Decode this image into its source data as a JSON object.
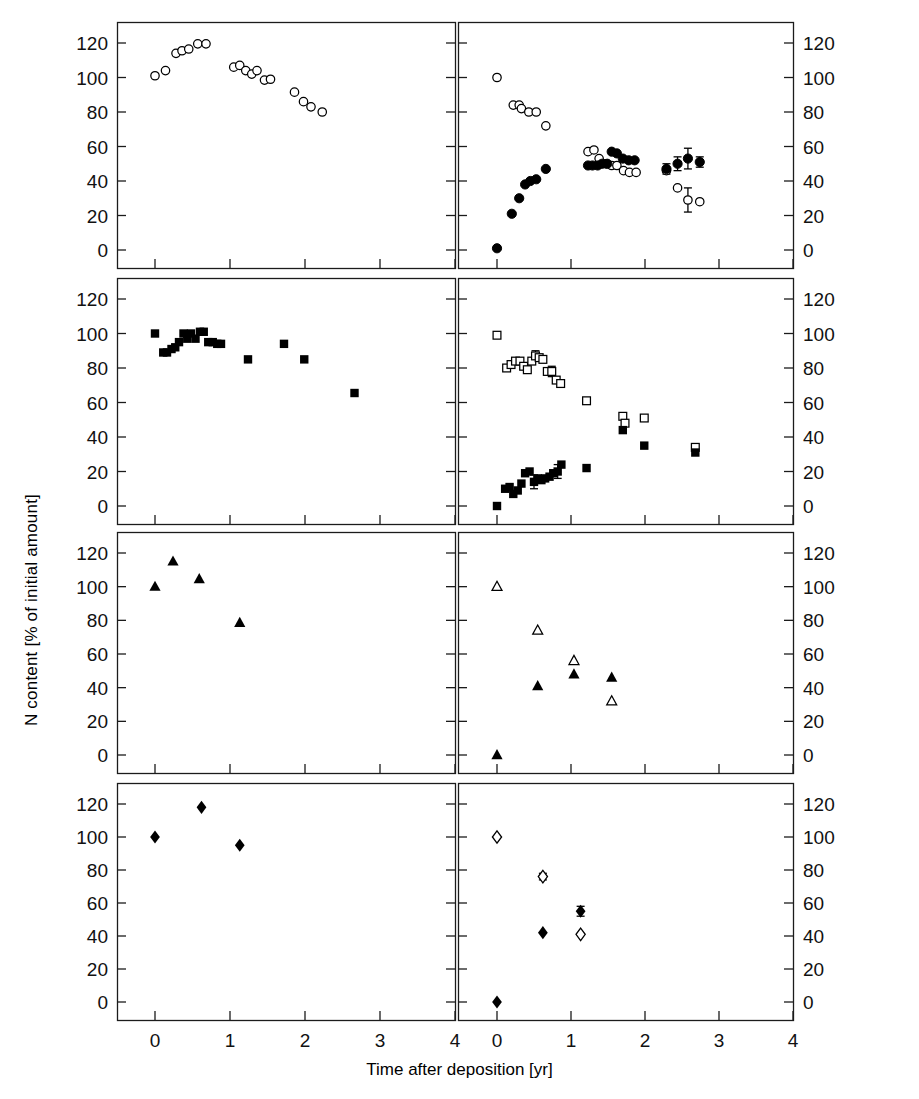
{
  "figure": {
    "xlabel": "Time after deposition [yr]",
    "ylabel_left": "N content [% of initial amount]",
    "ylabel_right": "Released N or incorporated N [% of initial amount]",
    "legend": {
      "line1": "N release (open symbols)",
      "line2": "N incorporation (closed symbols)"
    },
    "panel_titles": {
      "aubure09": "Aubure, 0.9% N",
      "aubure15": "Aubure, 1.5% N",
      "ebrach": "Ebrach",
      "collelongo": "Collelongo"
    },
    "yticks": [
      0,
      20,
      40,
      60,
      80,
      100,
      120
    ],
    "xticks": [
      0,
      1,
      2,
      3,
      4
    ],
    "colors": {
      "axis": "#1b1b1b",
      "marker": "#000000",
      "background": "#ffffff"
    }
  },
  "chart_data": [
    {
      "type": "scatter",
      "panel": "Aubure, 0.9% N — N content",
      "row": 0,
      "col": 0,
      "xlabel": "Time after deposition [yr]",
      "ylabel": "N content [% of initial amount]",
      "xlim": [
        -0.32,
        4.0
      ],
      "ylim": [
        -8,
        130
      ],
      "grid": false,
      "series": [
        {
          "name": "N content",
          "marker": "open-circle",
          "points": [
            [
              0.0,
              101
            ],
            [
              0.14,
              104
            ],
            [
              0.28,
              114
            ],
            [
              0.36,
              115.5
            ],
            [
              0.45,
              116.5
            ],
            [
              0.57,
              119.5
            ],
            [
              0.68,
              119.5
            ],
            [
              1.05,
              106
            ],
            [
              1.13,
              107
            ],
            [
              1.21,
              104
            ],
            [
              1.29,
              102
            ],
            [
              1.36,
              104
            ],
            [
              1.46,
              98.5
            ],
            [
              1.54,
              99
            ],
            [
              1.86,
              91.5
            ],
            [
              1.98,
              86
            ],
            [
              2.08,
              83
            ],
            [
              2.23,
              80
            ]
          ]
        }
      ]
    },
    {
      "type": "scatter",
      "panel": "Aubure, 0.9% N — N release / incorporation",
      "row": 0,
      "col": 1,
      "xlim": [
        -0.32,
        4.0
      ],
      "ylim": [
        -8,
        130
      ],
      "grid": false,
      "series": [
        {
          "name": "N release (open symbols)",
          "marker": "open-circle",
          "points": [
            [
              0.0,
              100
            ],
            [
              0.22,
              84
            ],
            [
              0.3,
              84
            ],
            [
              0.33,
              82
            ],
            [
              0.43,
              80
            ],
            [
              0.53,
              80
            ],
            [
              0.66,
              72
            ],
            [
              1.23,
              57
            ],
            [
              1.31,
              58
            ],
            [
              1.38,
              53
            ],
            [
              1.47,
              50
            ],
            [
              1.55,
              49
            ],
            [
              1.62,
              49
            ],
            [
              1.71,
              46
            ],
            [
              1.79,
              45
            ],
            [
              1.88,
              45
            ],
            [
              2.29,
              46
            ],
            [
              2.44,
              36
            ],
            [
              2.58,
              29
            ],
            [
              2.74,
              28
            ]
          ],
          "errorbars": [
            {
              "x": 2.58,
              "y": 29,
              "err": 7
            }
          ]
        },
        {
          "name": "N incorporation (closed symbols)",
          "marker": "filled-circle",
          "points": [
            [
              0.0,
              1
            ],
            [
              0.2,
              21
            ],
            [
              0.3,
              30
            ],
            [
              0.38,
              38
            ],
            [
              0.45,
              40
            ],
            [
              0.53,
              41
            ],
            [
              0.66,
              47
            ],
            [
              1.23,
              49
            ],
            [
              1.29,
              49
            ],
            [
              1.36,
              49
            ],
            [
              1.42,
              50
            ],
            [
              1.49,
              50
            ],
            [
              1.55,
              57
            ],
            [
              1.62,
              56
            ],
            [
              1.7,
              53
            ],
            [
              1.78,
              52
            ],
            [
              1.86,
              52
            ],
            [
              2.29,
              47
            ],
            [
              2.44,
              50
            ],
            [
              2.58,
              53
            ],
            [
              2.74,
              51
            ]
          ],
          "errorbars": [
            {
              "x": 2.29,
              "y": 47,
              "err": 3
            },
            {
              "x": 2.44,
              "y": 50,
              "err": 4
            },
            {
              "x": 2.58,
              "y": 53,
              "err": 6
            },
            {
              "x": 2.74,
              "y": 51,
              "err": 3
            }
          ]
        }
      ]
    },
    {
      "type": "scatter",
      "panel": "Aubure, 1.5% N — N content",
      "row": 1,
      "col": 0,
      "xlim": [
        -0.32,
        4.0
      ],
      "ylim": [
        -8,
        130
      ],
      "grid": false,
      "series": [
        {
          "name": "N content",
          "marker": "filled-square",
          "points": [
            [
              0.0,
              100
            ],
            [
              0.11,
              89
            ],
            [
              0.16,
              89
            ],
            [
              0.22,
              91
            ],
            [
              0.27,
              92
            ],
            [
              0.32,
              95
            ],
            [
              0.38,
              100
            ],
            [
              0.43,
              97
            ],
            [
              0.48,
              100
            ],
            [
              0.54,
              97
            ],
            [
              0.6,
              101
            ],
            [
              0.65,
              101
            ],
            [
              0.71,
              95
            ],
            [
              0.77,
              95
            ],
            [
              0.83,
              94
            ],
            [
              0.88,
              94
            ],
            [
              1.24,
              85
            ],
            [
              1.72,
              94
            ],
            [
              1.99,
              85
            ],
            [
              2.66,
              65.5
            ]
          ]
        }
      ]
    },
    {
      "type": "scatter",
      "panel": "Aubure, 1.5% N — N release / incorporation",
      "row": 1,
      "col": 1,
      "xlim": [
        -0.32,
        4.0
      ],
      "ylim": [
        -8,
        130
      ],
      "grid": false,
      "series": [
        {
          "name": "N release (open symbols)",
          "marker": "open-square",
          "points": [
            [
              0.0,
              99
            ],
            [
              0.13,
              80
            ],
            [
              0.19,
              82
            ],
            [
              0.25,
              84
            ],
            [
              0.31,
              84
            ],
            [
              0.36,
              81
            ],
            [
              0.41,
              79
            ],
            [
              0.47,
              84
            ],
            [
              0.52,
              87
            ],
            [
              0.57,
              86
            ],
            [
              0.62,
              85
            ],
            [
              0.68,
              78
            ],
            [
              0.74,
              78
            ],
            [
              0.8,
              73
            ],
            [
              0.86,
              71
            ],
            [
              1.21,
              61
            ],
            [
              1.7,
              52
            ],
            [
              1.73,
              48
            ],
            [
              1.99,
              51
            ],
            [
              2.68,
              34
            ]
          ],
          "errorbars": [
            {
              "x": 0.52,
              "y": 87,
              "err": 3
            },
            {
              "x": 0.74,
              "y": 78,
              "err": 3
            }
          ]
        },
        {
          "name": "N incorporation (closed symbols)",
          "marker": "filled-square",
          "points": [
            [
              0.0,
              0
            ],
            [
              0.11,
              10
            ],
            [
              0.17,
              11
            ],
            [
              0.22,
              7
            ],
            [
              0.28,
              9
            ],
            [
              0.33,
              13
            ],
            [
              0.38,
              19
            ],
            [
              0.44,
              20
            ],
            [
              0.5,
              14
            ],
            [
              0.55,
              16
            ],
            [
              0.6,
              15
            ],
            [
              0.65,
              16
            ],
            [
              0.71,
              17
            ],
            [
              0.76,
              19
            ],
            [
              0.82,
              20
            ],
            [
              0.87,
              24
            ],
            [
              1.21,
              22
            ],
            [
              1.7,
              44
            ],
            [
              1.99,
              35
            ],
            [
              2.68,
              31
            ]
          ],
          "errorbars": [
            {
              "x": 0.5,
              "y": 14,
              "err": 4
            },
            {
              "x": 0.82,
              "y": 20,
              "err": 4
            }
          ]
        }
      ]
    },
    {
      "type": "scatter",
      "panel": "Ebrach — N content",
      "row": 2,
      "col": 0,
      "xlim": [
        -0.32,
        4.0
      ],
      "ylim": [
        -8,
        130
      ],
      "grid": false,
      "series": [
        {
          "name": "N content",
          "marker": "filled-triangle",
          "points": [
            [
              0.0,
              100
            ],
            [
              0.24,
              115
            ],
            [
              0.59,
              104.5
            ],
            [
              1.13,
              78.5
            ]
          ]
        }
      ]
    },
    {
      "type": "scatter",
      "panel": "Ebrach — N release / incorporation",
      "row": 2,
      "col": 1,
      "xlim": [
        -0.32,
        4.0
      ],
      "ylim": [
        -8,
        130
      ],
      "grid": false,
      "series": [
        {
          "name": "N release (open symbols)",
          "marker": "open-triangle",
          "points": [
            [
              0.0,
              100
            ],
            [
              0.55,
              74
            ],
            [
              1.04,
              56
            ],
            [
              1.55,
              32
            ]
          ]
        },
        {
          "name": "N incorporation (closed symbols)",
          "marker": "filled-triangle",
          "points": [
            [
              0.0,
              0
            ],
            [
              0.55,
              41
            ],
            [
              1.04,
              48
            ],
            [
              1.55,
              46
            ]
          ]
        }
      ]
    },
    {
      "type": "scatter",
      "panel": "Collelongo — N content",
      "row": 3,
      "col": 0,
      "xlim": [
        -0.32,
        4.0
      ],
      "ylim": [
        -8,
        130
      ],
      "grid": false,
      "series": [
        {
          "name": "N content",
          "marker": "filled-diamond",
          "points": [
            [
              0.0,
              100
            ],
            [
              0.62,
              118
            ],
            [
              1.13,
              95
            ]
          ]
        }
      ]
    },
    {
      "type": "scatter",
      "panel": "Collelongo — N release / incorporation",
      "row": 3,
      "col": 1,
      "xlim": [
        -0.32,
        4.0
      ],
      "ylim": [
        -8,
        130
      ],
      "grid": false,
      "series": [
        {
          "name": "N release (open symbols)",
          "marker": "open-diamond",
          "points": [
            [
              0.0,
              100
            ],
            [
              0.62,
              76
            ],
            [
              1.13,
              41
            ]
          ]
        },
        {
          "name": "N incorporation (closed symbols)",
          "marker": "filled-diamond",
          "points": [
            [
              0.0,
              0
            ],
            [
              0.62,
              42
            ],
            [
              1.13,
              55
            ]
          ]
        },
        {
          "name": "error bars",
          "marker": "none",
          "points": [],
          "errorbars": [
            {
              "x": 0.62,
              "y": 76,
              "err": 2
            },
            {
              "x": 1.13,
              "y": 55,
              "err": 3
            }
          ]
        }
      ]
    }
  ]
}
